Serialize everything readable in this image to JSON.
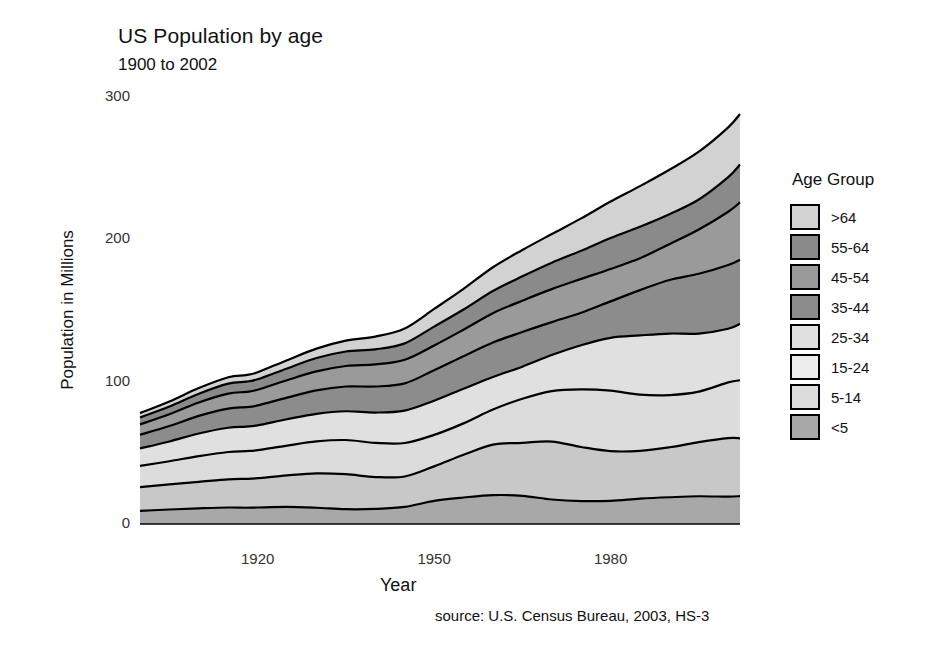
{
  "chart_data": {
    "type": "area",
    "stacked": true,
    "title": "US Population by age",
    "subtitle": "1900 to 2002",
    "xlabel": "Year",
    "ylabel": "Population in Millions",
    "source": "source: U.S. Census Bureau, 2003, HS-3",
    "legend_title": "Age Group",
    "legend_position": "right",
    "grid": false,
    "xlim": [
      1900,
      2002
    ],
    "ylim": [
      0,
      300
    ],
    "xticks": [
      1920,
      1950,
      1980
    ],
    "yticks": [
      0,
      100,
      200,
      300
    ],
    "x": [
      1900,
      1905,
      1910,
      1915,
      1918,
      1920,
      1925,
      1930,
      1935,
      1940,
      1945,
      1950,
      1955,
      1960,
      1965,
      1970,
      1975,
      1980,
      1985,
      1990,
      1995,
      2000,
      2002
    ],
    "stack_order_bottom_to_top": [
      "<5",
      "5-14",
      "15-24",
      "25-34",
      "35-44",
      "45-54",
      "55-64",
      ">64"
    ],
    "series": [
      {
        "name": "<5",
        "color": "#a8a8a8",
        "values": [
          9.2,
          10.2,
          11.0,
          11.6,
          11.4,
          11.6,
          12.0,
          11.4,
          10.4,
          10.6,
          12.0,
          16.2,
          18.6,
          20.3,
          19.8,
          17.2,
          16.1,
          16.3,
          17.8,
          18.8,
          19.5,
          19.2,
          19.6
        ]
      },
      {
        "name": "5-14",
        "color": "#c8c8c8",
        "values": [
          16.7,
          17.6,
          18.6,
          19.8,
          20.3,
          20.6,
          22.2,
          24.2,
          24.6,
          22.4,
          21.4,
          24.3,
          30.0,
          35.5,
          37.2,
          40.7,
          38.0,
          34.9,
          33.6,
          35.1,
          38.0,
          41.1,
          40.6
        ]
      },
      {
        "name": "15-24",
        "color": "#dcdcdc",
        "values": [
          14.9,
          16.3,
          18.1,
          19.2,
          19.5,
          19.7,
          20.9,
          22.4,
          24.0,
          24.0,
          23.5,
          22.1,
          22.1,
          24.6,
          31.0,
          35.5,
          40.5,
          42.5,
          39.5,
          36.7,
          35.5,
          39.2,
          40.8
        ]
      },
      {
        "name": "25-34",
        "color": "#e0e0e0",
        "values": [
          12.3,
          13.9,
          15.9,
          17.0,
          17.2,
          17.4,
          18.5,
          19.4,
          20.2,
          21.3,
          22.8,
          24.0,
          24.3,
          22.9,
          22.5,
          25.3,
          31.0,
          37.1,
          41.6,
          43.2,
          40.8,
          37.7,
          39.7
        ]
      },
      {
        "name": "35-44",
        "color": "#8c8c8c",
        "values": [
          9.6,
          10.8,
          12.4,
          13.5,
          13.7,
          14.0,
          15.2,
          16.5,
          17.4,
          18.3,
          19.1,
          21.5,
          22.9,
          24.2,
          24.4,
          23.1,
          22.8,
          25.6,
          31.8,
          37.6,
          42.0,
          44.8,
          44.9
        ]
      },
      {
        "name": "45-54",
        "color": "#9a9a9a",
        "values": [
          7.3,
          8.3,
          9.4,
          10.5,
          10.7,
          11.0,
          12.2,
          13.3,
          14.4,
          15.5,
          16.6,
          17.3,
          18.6,
          20.6,
          22.0,
          23.2,
          23.8,
          22.8,
          22.4,
          25.2,
          31.1,
          37.4,
          40.3
        ]
      },
      {
        "name": "55-64",
        "color": "#8a8a8a",
        "values": [
          4.8,
          5.4,
          6.1,
          7.0,
          7.2,
          7.4,
          8.3,
          9.4,
          10.2,
          10.6,
          11.5,
          13.3,
          14.2,
          15.6,
          17.1,
          18.6,
          19.8,
          21.7,
          22.2,
          21.1,
          21.1,
          24.3,
          26.6
        ]
      },
      {
        "name": ">64",
        "color": "#d2d2d2",
        "values": [
          3.1,
          3.6,
          4.0,
          4.5,
          4.6,
          4.9,
          5.8,
          6.6,
          7.6,
          9.0,
          10.5,
          12.4,
          14.5,
          16.7,
          18.5,
          20.1,
          22.7,
          25.7,
          28.5,
          31.2,
          33.6,
          35.0,
          35.6
        ]
      }
    ],
    "totals_note": "Total rises from about 78 million in 1900 to about 288 million in 2002"
  },
  "legend": {
    "title": "Age Group",
    "items": [
      {
        "label": ">64",
        "color": "#d2d2d2"
      },
      {
        "label": "55-64",
        "color": "#8a8a8a"
      },
      {
        "label": "45-54",
        "color": "#9a9a9a"
      },
      {
        "label": "35-44",
        "color": "#8c8c8c"
      },
      {
        "label": "25-34",
        "color": "#e0e0e0"
      },
      {
        "label": "15-24",
        "color": "#ededed"
      },
      {
        "label": "5-14",
        "color": "#dcdcdc"
      },
      {
        "label": "<5",
        "color": "#a8a8a8"
      }
    ]
  },
  "axes": {
    "yticks": [
      "300",
      "200",
      "100",
      "0"
    ],
    "xticks": [
      "1920",
      "1950",
      "1980"
    ]
  }
}
